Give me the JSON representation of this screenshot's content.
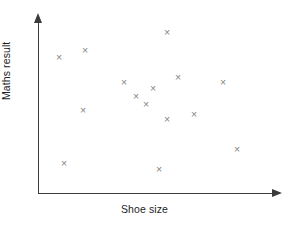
{
  "chart_data": {
    "type": "scatter",
    "title": "",
    "xlabel": "Shoe size",
    "ylabel": "Maths result",
    "grid": false,
    "legend": null,
    "xlim": [
      0,
      100
    ],
    "ylim": [
      0,
      100
    ],
    "xticks": [],
    "yticks": [],
    "axis_style": "arrow-ended, no tick marks, no numeric scale",
    "marker": "x",
    "marker_color": "#848484",
    "axis_color": "#3b3b3b",
    "background_color": "#ffffff",
    "n_points": 15,
    "points": [
      {
        "label": "p1",
        "px": 59,
        "py": 57,
        "x": 12,
        "y": 79
      },
      {
        "label": "p2",
        "px": 85,
        "py": 50,
        "x": 23,
        "y": 83
      },
      {
        "label": "p3",
        "px": 167,
        "py": 32,
        "x": 57,
        "y": 94
      },
      {
        "label": "p4",
        "px": 83,
        "py": 110,
        "x": 22,
        "y": 49
      },
      {
        "label": "p5",
        "px": 124,
        "py": 82,
        "x": 39,
        "y": 65
      },
      {
        "label": "p6",
        "px": 153,
        "py": 88,
        "x": 51,
        "y": 61
      },
      {
        "label": "p7",
        "px": 146,
        "py": 104,
        "x": 48,
        "y": 52
      },
      {
        "label": "p8",
        "px": 167,
        "py": 119,
        "x": 57,
        "y": 43
      },
      {
        "label": "p9",
        "px": 194,
        "py": 114,
        "x": 68,
        "y": 46
      },
      {
        "label": "p10",
        "px": 223,
        "py": 82,
        "x": 80,
        "y": 65
      },
      {
        "label": "p11",
        "px": 237,
        "py": 149,
        "x": 86,
        "y": 26
      },
      {
        "label": "p12",
        "px": 64,
        "py": 163,
        "x": 14,
        "y": 17
      },
      {
        "label": "p13",
        "px": 159,
        "py": 169,
        "x": 54,
        "y": 14
      },
      {
        "label": "p14",
        "px": 136,
        "py": 96,
        "x": 44,
        "y": 56
      },
      {
        "label": "p15",
        "px": 178,
        "py": 77,
        "x": 62,
        "y": 68
      }
    ],
    "marker_glyph": "×"
  },
  "axes": {
    "x_title": "Shoe size",
    "y_title": "Maths result"
  }
}
